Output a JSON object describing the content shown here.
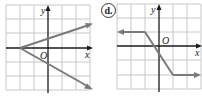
{
  "graphs": [
    {
      "id": "c",
      "label": "",
      "axis_labels": {
        "x": "x",
        "y": "y",
        "origin": "O"
      },
      "grid": {
        "xmin": -3,
        "xmax": 3,
        "ymin": -3,
        "ymax": 3
      },
      "segments": [
        {
          "from": [
            -3,
            0
          ],
          "to": [
            3,
            2
          ],
          "arrow_end": true
        },
        {
          "from": [
            -3,
            0
          ],
          "to": [
            3,
            -2
          ],
          "arrow_end": true
        }
      ],
      "line_color": "#7a7a7a"
    },
    {
      "id": "d",
      "label": "d.",
      "axis_labels": {
        "x": "x",
        "y": "y",
        "origin": "O"
      },
      "grid": {
        "xmin": -3,
        "xmax": 3,
        "ymin": -3,
        "ymax": 3
      },
      "segments": [
        {
          "from": [
            -1,
            1
          ],
          "to": [
            -3,
            1
          ],
          "arrow_end": true
        },
        {
          "from": [
            -1,
            1
          ],
          "to": [
            1,
            -2
          ],
          "arrow_end": false
        },
        {
          "from": [
            1,
            -2
          ],
          "to": [
            3,
            -2
          ],
          "arrow_end": true
        }
      ],
      "line_color": "#7a7a7a"
    }
  ],
  "colors": {
    "grid": "#c8c8c8",
    "axis": "#1a1a1a",
    "line": "#7a7a7a"
  }
}
